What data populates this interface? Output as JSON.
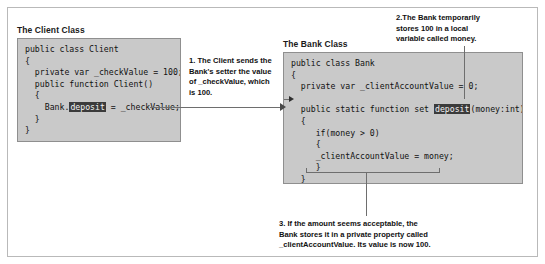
{
  "figure": {
    "client_section": {
      "caption": "The Client Class",
      "code_lines": [
        {
          "text": "public class Client"
        },
        {
          "text": "{"
        },
        {
          "text": "  private var _checkValue = 100;"
        },
        {
          "text": "  public function Client()"
        },
        {
          "text": "  {"
        },
        {
          "pre": "    Bank.",
          "highlight": "deposit",
          "post": " = _checkValue;"
        },
        {
          "text": "  }"
        },
        {
          "text": "}"
        }
      ]
    },
    "bank_section": {
      "caption": "The Bank Class",
      "code_lines": [
        {
          "text": "public class Bank"
        },
        {
          "text": "{"
        },
        {
          "text": "  private var _clientAccountValue = 0;"
        },
        {
          "text": ""
        },
        {
          "pre": "  public static function set ",
          "highlight": "deposit",
          "post": "(money:int):void"
        },
        {
          "text": "  {"
        },
        {
          "text": "     if(money > 0)"
        },
        {
          "text": "     {"
        },
        {
          "text": "     _clientAccountValue = money;"
        },
        {
          "text": "     }"
        },
        {
          "text": "  }"
        },
        {
          "text": "}"
        }
      ]
    },
    "annotations": [
      {
        "id": "annotation-1",
        "lines": [
          "1. The Client sends the",
          "Bank's setter the value",
          "of _checkValue, which",
          "is 100."
        ]
      },
      {
        "id": "annotation-2",
        "lines": [
          "2.The Bank temporarily",
          "stores 100 in a local",
          "variable called money."
        ]
      },
      {
        "id": "annotation-3",
        "lines": [
          "3. If the amount seems acceptable, the",
          "Bank stores it in a private property called",
          "_clientAccountValue. Its value is now 100."
        ]
      }
    ],
    "colors": {
      "code_background": "#c9c9c9",
      "code_border": "#8f8f8f",
      "frame_border": "#b9b9b9",
      "highlight_background": "#3b3b3b",
      "highlight_text": "#f2f2f2",
      "leader_line": "#6e6e6e",
      "page_background": "#ffffff"
    }
  }
}
